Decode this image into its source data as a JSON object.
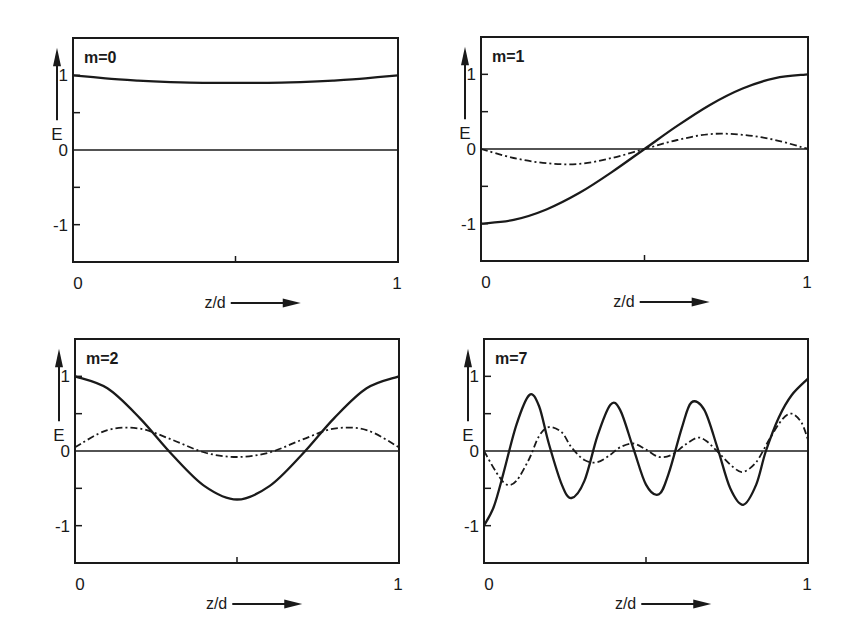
{
  "figure": {
    "panels_layout": "2x2",
    "line_color": "#1a1a1a",
    "background": "#ffffff"
  },
  "chart_data": [
    {
      "type": "line",
      "title": "m=0",
      "xlabel": "z/d",
      "ylabel": "E",
      "xlim": [
        0,
        1
      ],
      "ylim": [
        -1.5,
        1.5
      ],
      "x_ticks": [
        "0",
        "1"
      ],
      "y_ticks": [
        "1",
        "0",
        "-1"
      ],
      "grid": false,
      "frame": {
        "left": 73,
        "top": 38,
        "right": 398,
        "bottom": 262
      },
      "series": [
        {
          "name": "solid",
          "style": "solid",
          "x": [
            0,
            0.1,
            0.2,
            0.3,
            0.4,
            0.5,
            0.6,
            0.7,
            0.8,
            0.9,
            1.0
          ],
          "values": [
            1.0,
            0.96,
            0.93,
            0.91,
            0.9,
            0.9,
            0.9,
            0.91,
            0.93,
            0.96,
            1.0
          ]
        }
      ]
    },
    {
      "type": "line",
      "title": "m=1",
      "xlabel": "z/d",
      "ylabel": "E",
      "xlim": [
        0,
        1
      ],
      "ylim": [
        -1.5,
        1.5
      ],
      "x_ticks": [
        "0",
        "1"
      ],
      "y_ticks": [
        "1",
        "0",
        "-1"
      ],
      "grid": false,
      "frame": {
        "left": 481,
        "top": 37,
        "right": 808,
        "bottom": 261
      },
      "series": [
        {
          "name": "solid",
          "style": "solid",
          "x": [
            0,
            0.1,
            0.2,
            0.3,
            0.4,
            0.5,
            0.6,
            0.7,
            0.8,
            0.9,
            1.0
          ],
          "values": [
            -1.0,
            -0.95,
            -0.81,
            -0.59,
            -0.31,
            0.0,
            0.31,
            0.59,
            0.81,
            0.95,
            1.0
          ]
        },
        {
          "name": "dashed",
          "style": "dash-dot",
          "x": [
            0,
            0.1,
            0.2,
            0.3,
            0.4,
            0.5,
            0.6,
            0.7,
            0.8,
            0.9,
            1.0
          ],
          "values": [
            0.0,
            -0.12,
            -0.19,
            -0.2,
            -0.12,
            0.0,
            0.12,
            0.2,
            0.19,
            0.12,
            0.0
          ]
        }
      ]
    },
    {
      "type": "line",
      "title": "m=2",
      "xlabel": "z/d",
      "ylabel": "E",
      "xlim": [
        0,
        1
      ],
      "ylim": [
        -1.5,
        1.5
      ],
      "x_ticks": [
        "0",
        "1"
      ],
      "y_ticks": [
        "1",
        "0",
        "-1"
      ],
      "grid": false,
      "frame": {
        "left": 75,
        "top": 339,
        "right": 399,
        "bottom": 563
      },
      "series": [
        {
          "name": "solid",
          "style": "solid",
          "x": [
            0,
            0.1,
            0.2,
            0.3,
            0.4,
            0.5,
            0.6,
            0.7,
            0.8,
            0.9,
            1.0
          ],
          "values": [
            1.0,
            0.84,
            0.44,
            -0.05,
            -0.47,
            -0.65,
            -0.47,
            -0.05,
            0.44,
            0.84,
            1.0
          ]
        },
        {
          "name": "dashed",
          "style": "dash-dot",
          "x": [
            0,
            0.1,
            0.2,
            0.3,
            0.4,
            0.5,
            0.6,
            0.7,
            0.8,
            0.9,
            1.0
          ],
          "values": [
            0.05,
            0.28,
            0.3,
            0.15,
            -0.02,
            -0.08,
            -0.02,
            0.15,
            0.3,
            0.28,
            0.05
          ]
        }
      ]
    },
    {
      "type": "line",
      "title": "m=7",
      "xlabel": "z/d",
      "ylabel": "E",
      "xlim": [
        0,
        1
      ],
      "ylim": [
        -1.5,
        1.5
      ],
      "x_ticks": [
        "0",
        "1"
      ],
      "y_ticks": [
        "1",
        "0",
        "-1"
      ],
      "grid": false,
      "frame": {
        "left": 484,
        "top": 339,
        "right": 808,
        "bottom": 563
      },
      "series": [
        {
          "name": "solid",
          "style": "solid",
          "x": [
            0,
            0.03,
            0.06,
            0.1,
            0.14,
            0.17,
            0.2,
            0.24,
            0.27,
            0.31,
            0.35,
            0.39,
            0.42,
            0.46,
            0.5,
            0.54,
            0.57,
            0.61,
            0.64,
            0.68,
            0.72,
            0.76,
            0.8,
            0.84,
            0.87,
            0.91,
            0.95,
            1.0
          ],
          "values": [
            -1.0,
            -0.75,
            -0.3,
            0.35,
            0.75,
            0.6,
            0.1,
            -0.45,
            -0.63,
            -0.4,
            0.2,
            0.62,
            0.55,
            0.05,
            -0.45,
            -0.58,
            -0.3,
            0.3,
            0.65,
            0.55,
            0.05,
            -0.5,
            -0.72,
            -0.45,
            0.0,
            0.45,
            0.75,
            0.97
          ]
        },
        {
          "name": "dashed",
          "style": "dash-dot",
          "x": [
            0,
            0.04,
            0.07,
            0.1,
            0.14,
            0.17,
            0.2,
            0.24,
            0.27,
            0.31,
            0.35,
            0.39,
            0.42,
            0.46,
            0.5,
            0.54,
            0.58,
            0.62,
            0.66,
            0.69,
            0.73,
            0.77,
            0.8,
            0.84,
            0.88,
            0.92,
            0.95,
            0.98,
            1.0
          ],
          "values": [
            0.0,
            -0.3,
            -0.45,
            -0.4,
            -0.1,
            0.2,
            0.32,
            0.25,
            0.05,
            -0.12,
            -0.15,
            -0.05,
            0.05,
            0.1,
            0.02,
            -0.08,
            -0.05,
            0.08,
            0.18,
            0.12,
            -0.05,
            -0.22,
            -0.28,
            -0.15,
            0.15,
            0.42,
            0.5,
            0.38,
            0.15
          ]
        }
      ]
    }
  ]
}
